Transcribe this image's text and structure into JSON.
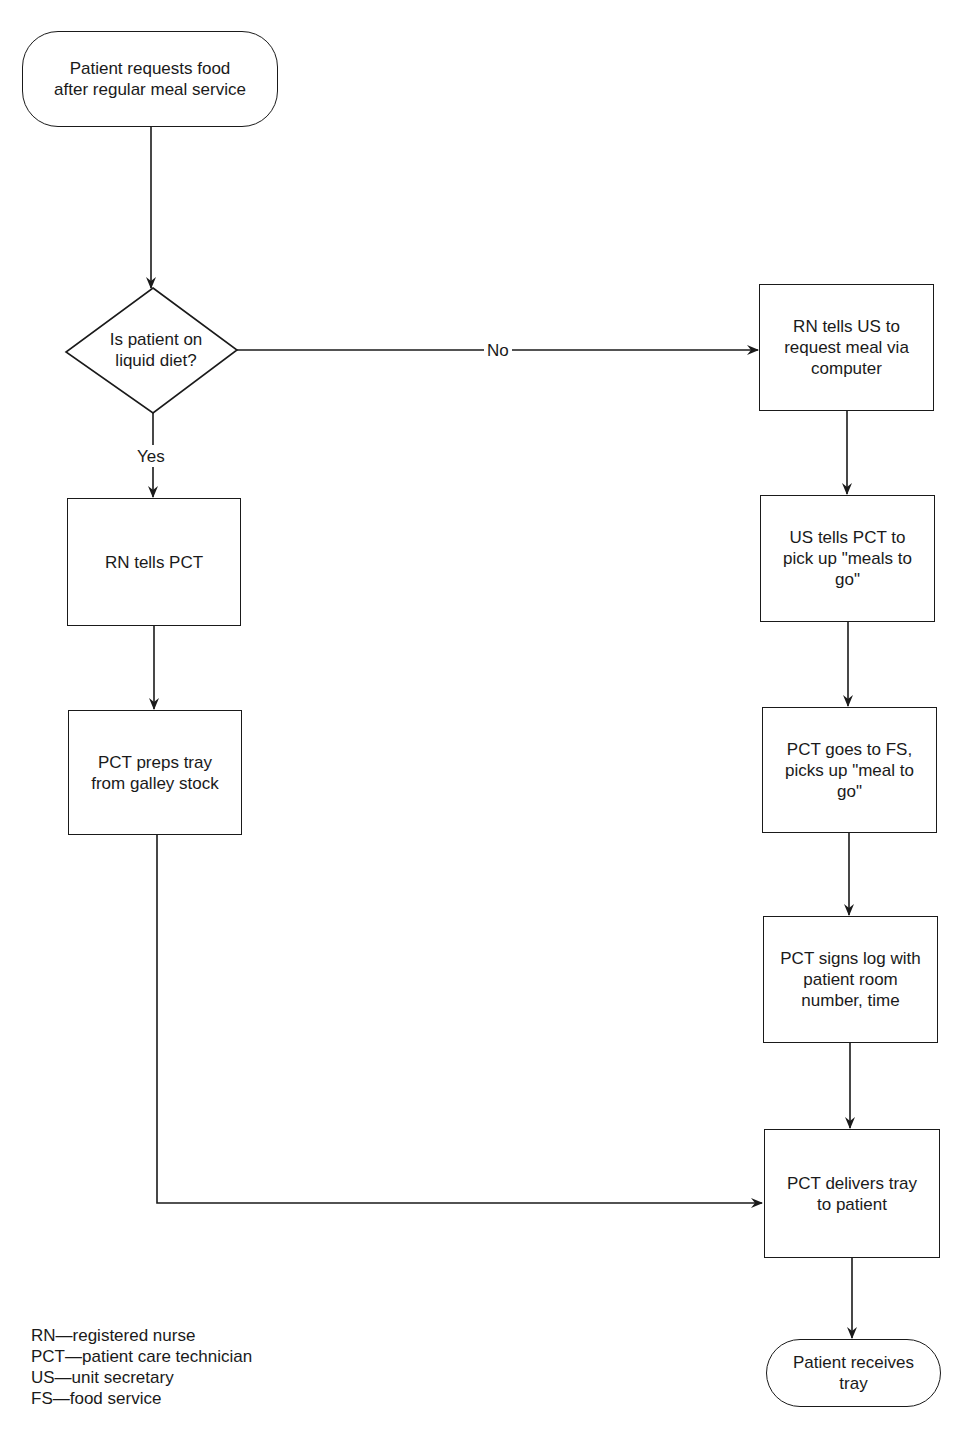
{
  "diagram": {
    "type": "flowchart",
    "start": {
      "label": "Patient requests food\nafter regular meal service"
    },
    "decision": {
      "label": "Is patient on\nliquid diet?",
      "yes_label": "Yes",
      "no_label": "No"
    },
    "yes_branch": [
      {
        "label": "RN tells PCT"
      },
      {
        "label": "PCT preps tray\nfrom galley stock"
      }
    ],
    "no_branch": [
      {
        "label": "RN tells US to\nrequest meal via\ncomputer"
      },
      {
        "label": "US tells PCT to\npick up \"meals to\ngo\""
      },
      {
        "label": "PCT goes to FS,\npicks up \"meal to\ngo\""
      },
      {
        "label": "PCT signs log with\npatient room\nnumber, time"
      }
    ],
    "merge": {
      "label": "PCT delivers tray\nto patient"
    },
    "end": {
      "label": "Patient receives\ntray"
    },
    "edges": [
      {
        "from": "start",
        "to": "decision"
      },
      {
        "from": "decision",
        "to": "yes_branch.0",
        "label": "Yes"
      },
      {
        "from": "decision",
        "to": "no_branch.0",
        "label": "No"
      },
      {
        "from": "yes_branch.0",
        "to": "yes_branch.1"
      },
      {
        "from": "yes_branch.1",
        "to": "merge"
      },
      {
        "from": "no_branch.0",
        "to": "no_branch.1"
      },
      {
        "from": "no_branch.1",
        "to": "no_branch.2"
      },
      {
        "from": "no_branch.2",
        "to": "no_branch.3"
      },
      {
        "from": "no_branch.3",
        "to": "merge"
      },
      {
        "from": "merge",
        "to": "end"
      }
    ]
  },
  "legend": [
    {
      "text": "RN—registered nurse"
    },
    {
      "text": "PCT—patient care technician"
    },
    {
      "text": "US—unit secretary"
    },
    {
      "text": "FS—food service"
    }
  ],
  "colors": {
    "stroke": "#1a1a1a",
    "background": "#ffffff"
  }
}
